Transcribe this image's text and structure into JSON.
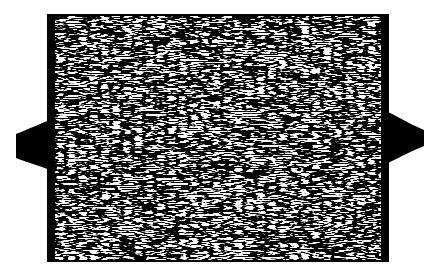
{
  "figure": {
    "colors": {
      "background": "#ffffff",
      "ink": "#000000",
      "paper": "#ffffff"
    },
    "specimen": {
      "body": {
        "x": 47,
        "y": 14,
        "width": 342,
        "height": 248
      },
      "left_border_width": 8,
      "right_border_width": 8,
      "left_tab": {
        "tip_x": 16,
        "tip_top": 134,
        "tip_bottom": 158,
        "base_top": 120,
        "base_bottom": 170
      },
      "right_tab": {
        "tip_x": 424,
        "tip_top": 130,
        "tip_bottom": 146,
        "base_top": 112,
        "base_bottom": 163
      }
    }
  }
}
